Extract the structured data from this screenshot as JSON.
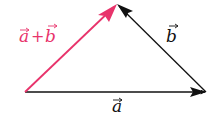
{
  "diagram": {
    "colors": {
      "sum": "#e8336b",
      "vector": "#111111",
      "background": "#ffffff"
    },
    "vectors": [
      {
        "id": "a",
        "label": "a",
        "from": [
          25,
          92
        ],
        "to": [
          206,
          92
        ],
        "color": "#111111"
      },
      {
        "id": "b",
        "label": "b",
        "from": [
          206,
          92
        ],
        "to": [
          117,
          4
        ],
        "color": "#111111"
      },
      {
        "id": "sum",
        "label": "a+b",
        "from": [
          25,
          92
        ],
        "to": [
          117,
          4
        ],
        "color": "#e8336b"
      }
    ],
    "labels": {
      "a": "a",
      "b": "b",
      "sum_a": "a",
      "sum_plus": "+",
      "sum_b": "b"
    }
  }
}
